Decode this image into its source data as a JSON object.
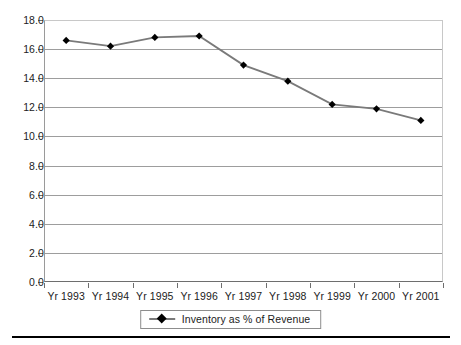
{
  "chart_data": {
    "type": "line",
    "title": "",
    "xlabel": "",
    "ylabel": "",
    "categories": [
      "Yr 1993",
      "Yr 1994",
      "Yr 1995",
      "Yr 1996",
      "Yr 1997",
      "Yr 1998",
      "Yr 1999",
      "Yr 2000",
      "Yr 2001"
    ],
    "series": [
      {
        "name": "Inventory as % of Revenue",
        "values": [
          16.6,
          16.2,
          16.8,
          16.9,
          14.9,
          13.8,
          12.2,
          11.9,
          11.1
        ],
        "line_color": "#7a7a7a",
        "marker_color": "#000000",
        "marker": "diamond"
      }
    ],
    "ylim": [
      0.0,
      18.0
    ],
    "ytick_step": 2.0,
    "ytick_labels": [
      "0.0",
      "2.0",
      "4.0",
      "6.0",
      "8.0",
      "10.0",
      "12.0",
      "14.0",
      "16.0",
      "18.0"
    ],
    "grid": "horizontal",
    "legend_position": "bottom-center"
  },
  "legend": {
    "entries": [
      {
        "label": "Inventory as % of Revenue",
        "marker_icon": "diamond-marker-icon"
      }
    ]
  },
  "colors": {
    "line": "#7a7a7a",
    "marker": "#000000",
    "gridline": "#9d9d9d",
    "axis": "#6e6e6e",
    "text": "#1b1b1b",
    "footer_rule": "#000000"
  }
}
